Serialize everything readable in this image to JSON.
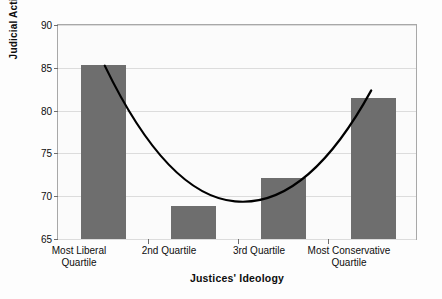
{
  "chart_data": {
    "type": "bar",
    "title": "",
    "xlabel": "Justices' Ideology",
    "ylabel": "Judicial Activism",
    "categories": [
      "Most Liberal Quartile",
      "2nd Quartile",
      "3rd Quartile",
      "Most Conservative Quartile"
    ],
    "category_lines": [
      [
        "Most Liberal",
        "Quartile"
      ],
      [
        "2nd Quartile",
        ""
      ],
      [
        "3rd Quartile",
        ""
      ],
      [
        "Most Conservative",
        "Quartile"
      ]
    ],
    "values": [
      85.3,
      68.9,
      72.1,
      81.5
    ],
    "ylim": [
      65,
      90
    ],
    "yticks": [
      65,
      70,
      75,
      80,
      85,
      90
    ],
    "ytick_labels": [
      "65",
      "70",
      "75",
      "80",
      "85",
      "90"
    ],
    "grid": true,
    "legend": "none",
    "series": [
      {
        "name": "Judicial Activism",
        "type": "bar",
        "values": [
          85.3,
          68.9,
          72.1,
          81.5
        ],
        "color": "#6e6e6e"
      },
      {
        "name": "Fitted quadratic trend",
        "type": "line",
        "color": "#000000",
        "x": [
          1,
          2,
          3,
          4
        ],
        "y": [
          85.2,
          69.6,
          69.9,
          82.6
        ],
        "minimum_y": 68.8
      }
    ],
    "colors": {
      "bar_fill": "#6e6e6e",
      "curve": "#000000",
      "gridline": "#dcdcdc",
      "frame": "#a8a8a8",
      "plot_background": "#fbfbfb",
      "figure_background": "#fdfdfd",
      "text": "#0d0d0d"
    }
  }
}
